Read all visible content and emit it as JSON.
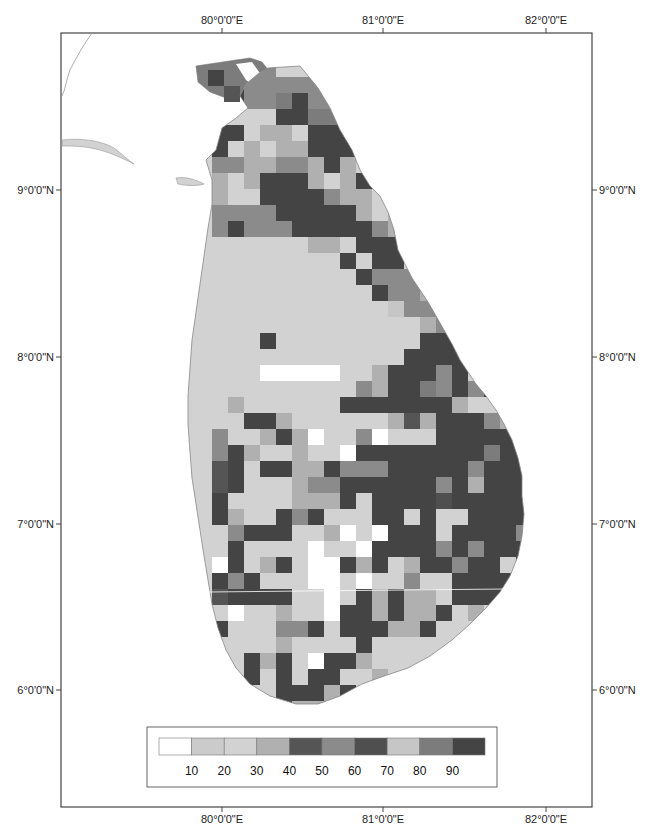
{
  "chart_data": {
    "type": "heatmap",
    "title": "",
    "x_axis": {
      "labels_top": [
        "80°0'0\"E",
        "81°0'0\"E",
        "82°0'0\"E"
      ],
      "labels_bottom": [
        "80°0'0\"E",
        "81°0'0\"E",
        "82°0'0\"E"
      ],
      "lon_values": [
        80,
        81,
        82
      ]
    },
    "y_axis": {
      "labels_left": [
        "9°0'0\"N",
        "8°0'0\"N",
        "7°0'0\"N",
        "6°0'0\"N"
      ],
      "labels_right": [
        "9°0'0\"N",
        "8°0'0\"N",
        "7°0'0\"N",
        "6°0'0\"N"
      ],
      "lat_values": [
        9,
        8,
        7,
        6
      ]
    },
    "legend": {
      "classes": [
        {
          "color": "#ffffff"
        },
        {
          "color": "#cbcbcb"
        },
        {
          "color": "#d2d2d2"
        },
        {
          "color": "#b0b0b0"
        },
        {
          "color": "#555555"
        },
        {
          "color": "#8b8b8b"
        },
        {
          "color": "#4f4f4f"
        },
        {
          "color": "#c6c6c6"
        },
        {
          "color": "#7c7c7c"
        },
        {
          "color": "#444444"
        }
      ],
      "break_labels": [
        "10",
        "20",
        "30",
        "40",
        "50",
        "60",
        "70",
        "80",
        "90"
      ]
    },
    "grid": {
      "origin_x": 180,
      "origin_y": 109,
      "cell": 16,
      "rows": [
        "..9955................",
        "..9955555.............",
        "..99558955............",
        "......9988............",
        "..99233299999.........",
        "..92323399999.........",
        "..55335539329.........",
        "..32399932399.........",
        "..32299995332.........",
        "..5555999993.3........",
        "..5955599999532.......",
        "..222222332999999.....",
        "..2222222292992999....",
        "..222222222955559.....",
        "..222222222295539.....",
        "..222222222227555.....",
        "..222222222222235.....",
        "..2229222222222999....",
        "..22222222222299995...",
        "..2220000022399959....",
        "..222222222539985959..",
        "..2322222299999993....",
        "..2299322222234399953.",
        "..52239302250222999995",
        "..593223220999999998999",
        "..492993395559999959999",
        "..49222355999999593999",
        "..922223339299996999990",
        "..9322959222992922999995",
        "..2599922302099929999599",
        "..2922220220999959599990",
        "..09239200939239959929990",
        "..9592220020225229999990",
        "..49999220293933299999",
        "..20223220993933923203",
        "..9222559299933922222",
        "..22223222292222222",
        "..22939209932222",
        "..2292929922323",
        "..99229993922222",
        "..22299339932222",
        "..22599995922",
        "..22222229",
        "...2220222"
      ]
    }
  }
}
